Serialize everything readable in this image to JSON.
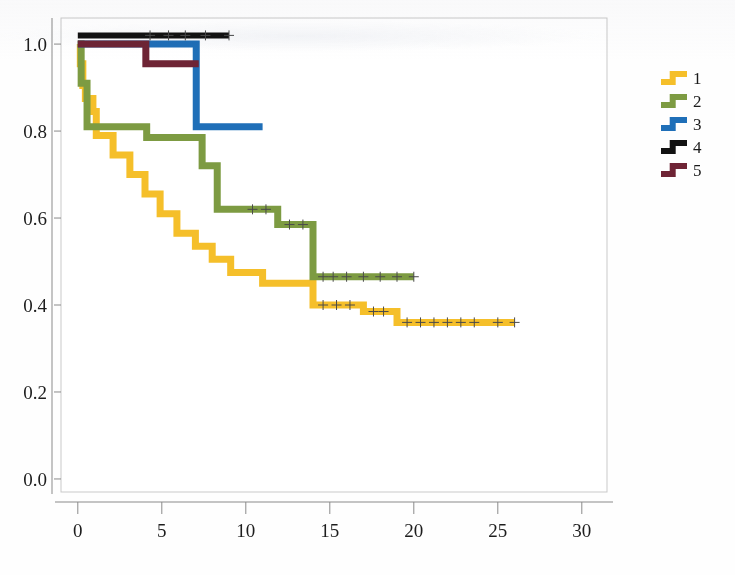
{
  "figure": {
    "background_color": "#fefefe",
    "plot_background_color": "#ffffff",
    "frame_color": "#c9c9c9",
    "axis_color": "#8a8a8a"
  },
  "chart_data": {
    "type": "line",
    "subtype": "kaplan-meier-step",
    "title": "",
    "subtitle": "",
    "xlabel": "",
    "ylabel": "",
    "xlim": [
      -1,
      31.5
    ],
    "ylim": [
      -0.03,
      1.06
    ],
    "xticks": [
      0,
      5,
      10,
      15,
      20,
      25,
      30
    ],
    "xtick_labels": [
      "0",
      "5",
      "10",
      "15",
      "20",
      "25",
      "30"
    ],
    "yticks": [
      0.0,
      0.2,
      0.4,
      0.6,
      0.8,
      1.0
    ],
    "ytick_labels": [
      "0.0",
      "0.2",
      "0.4",
      "0.6",
      "0.8",
      "1.0"
    ],
    "grid": false,
    "legend_position": "right",
    "series": [
      {
        "name": "1",
        "label": "1",
        "color": "#f5bf2a",
        "points": [
          [
            0.0,
            1.0
          ],
          [
            0.15,
            0.955
          ],
          [
            0.3,
            0.905
          ],
          [
            0.45,
            0.875
          ],
          [
            0.9,
            0.845
          ],
          [
            1.1,
            0.79
          ],
          [
            2.0,
            0.79
          ],
          [
            2.1,
            0.745
          ],
          [
            3.0,
            0.745
          ],
          [
            3.1,
            0.7
          ],
          [
            3.9,
            0.7
          ],
          [
            4.0,
            0.655
          ],
          [
            4.8,
            0.655
          ],
          [
            4.9,
            0.61
          ],
          [
            5.8,
            0.61
          ],
          [
            5.9,
            0.565
          ],
          [
            6.9,
            0.565
          ],
          [
            7.0,
            0.535
          ],
          [
            7.9,
            0.535
          ],
          [
            8.0,
            0.505
          ],
          [
            9.0,
            0.505
          ],
          [
            9.1,
            0.475
          ],
          [
            10.9,
            0.475
          ],
          [
            11.0,
            0.45
          ],
          [
            13.9,
            0.45
          ],
          [
            14.0,
            0.4
          ],
          [
            16.9,
            0.4
          ],
          [
            17.0,
            0.385
          ],
          [
            18.9,
            0.385
          ],
          [
            19.0,
            0.36
          ],
          [
            26.0,
            0.36
          ]
        ],
        "censor_times": [
          14.6,
          15.4,
          16.2,
          17.6,
          18.2,
          19.6,
          20.4,
          21.2,
          22.0,
          22.8,
          23.6,
          25.0,
          26.0
        ]
      },
      {
        "name": "2",
        "label": "2",
        "color": "#7d9b42",
        "points": [
          [
            0.0,
            1.0
          ],
          [
            0.2,
            0.91
          ],
          [
            0.45,
            0.91
          ],
          [
            0.55,
            0.81
          ],
          [
            4.0,
            0.81
          ],
          [
            4.1,
            0.785
          ],
          [
            7.3,
            0.785
          ],
          [
            7.4,
            0.72
          ],
          [
            8.2,
            0.72
          ],
          [
            8.3,
            0.62
          ],
          [
            11.8,
            0.62
          ],
          [
            11.9,
            0.585
          ],
          [
            13.9,
            0.585
          ],
          [
            14.0,
            0.465
          ],
          [
            20.0,
            0.465
          ]
        ],
        "censor_times": [
          10.4,
          11.2,
          12.6,
          13.4,
          14.6,
          15.2,
          16.0,
          17.0,
          18.0,
          19.0,
          20.0
        ]
      },
      {
        "name": "3",
        "label": "3",
        "color": "#1f6fb8",
        "points": [
          [
            0.0,
            1.0
          ],
          [
            7.0,
            1.0
          ],
          [
            7.05,
            0.81
          ],
          [
            11.0,
            0.81
          ]
        ],
        "censor_times": []
      },
      {
        "name": "4",
        "label": "4",
        "color": "#121212",
        "points": [
          [
            0.0,
            1.02
          ],
          [
            9.0,
            1.02
          ]
        ],
        "censor_times": [
          4.3,
          5.4,
          6.4,
          7.6,
          9.0
        ]
      },
      {
        "name": "5",
        "label": "5",
        "color": "#6e2435",
        "points": [
          [
            0.0,
            1.0
          ],
          [
            4.0,
            1.0
          ],
          [
            4.05,
            0.955
          ],
          [
            7.2,
            0.955
          ]
        ],
        "censor_times": []
      }
    ]
  },
  "legend": {
    "entries": [
      {
        "label": "1",
        "color": "#f5bf2a"
      },
      {
        "label": "2",
        "color": "#7d9b42"
      },
      {
        "label": "3",
        "color": "#1f6fb8"
      },
      {
        "label": "4",
        "color": "#121212"
      },
      {
        "label": "5",
        "color": "#6e2435"
      }
    ]
  }
}
